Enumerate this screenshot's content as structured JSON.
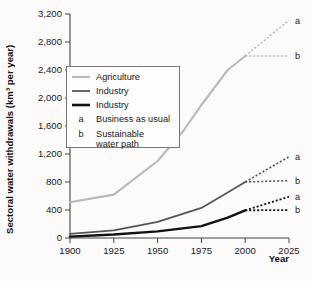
{
  "chart_data": {
    "type": "line",
    "title": "",
    "xlabel": "Year",
    "ylabel": "Sectoral water withdrawals (km³ per year)",
    "xlim": [
      1900,
      2025
    ],
    "ylim": [
      0,
      3200
    ],
    "xticks": [
      "1900",
      "1925",
      "1950",
      "1975",
      "2000",
      "2025"
    ],
    "yticks": [
      "0",
      "400",
      "800",
      "1,200",
      "1,600",
      "2,000",
      "2,400",
      "2,800",
      "3,200"
    ],
    "grid": false,
    "legend_position": "upper-left-inset",
    "series": [
      {
        "name": "Agriculture",
        "color": "#b9b9b9",
        "width": 2.1,
        "style": "solid",
        "x": [
          1900,
          1925,
          1950,
          1965,
          1975,
          1990,
          2000
        ],
        "values": [
          510,
          620,
          1100,
          1540,
          1900,
          2400,
          2600
        ]
      },
      {
        "name": "Industry",
        "color": "#555555",
        "width": 1.7,
        "style": "solid",
        "x": [
          1900,
          1925,
          1950,
          1975,
          1990,
          2000
        ],
        "values": [
          60,
          110,
          230,
          430,
          650,
          800
        ]
      },
      {
        "name": "Industry",
        "color": "#111111",
        "width": 2.4,
        "style": "solid",
        "x": [
          1900,
          1925,
          1950,
          1975,
          1990,
          2000
        ],
        "values": [
          20,
          50,
          95,
          170,
          290,
          395
        ]
      }
    ],
    "projections": [
      {
        "series": "Agriculture",
        "scenario": "a",
        "label": "a",
        "color": "#b9b9b9",
        "width": 1.6,
        "x": [
          2000,
          2025
        ],
        "values": [
          2600,
          3110
        ]
      },
      {
        "series": "Agriculture",
        "scenario": "b",
        "label": "b",
        "color": "#b9b9b9",
        "width": 1.6,
        "x": [
          2000,
          2025
        ],
        "values": [
          2600,
          2600
        ]
      },
      {
        "series": "Industry-1",
        "scenario": "a",
        "label": "a",
        "color": "#555555",
        "width": 1.6,
        "x": [
          2000,
          2025
        ],
        "values": [
          800,
          1160
        ]
      },
      {
        "series": "Industry-1",
        "scenario": "b",
        "label": "b",
        "color": "#555555",
        "width": 1.6,
        "x": [
          2000,
          2025
        ],
        "values": [
          800,
          820
        ]
      },
      {
        "series": "Industry-2",
        "scenario": "a",
        "label": "a",
        "color": "#111111",
        "width": 1.8,
        "x": [
          2000,
          2025
        ],
        "values": [
          395,
          590
        ]
      },
      {
        "series": "Industry-2",
        "scenario": "b",
        "label": "b",
        "color": "#111111",
        "width": 1.8,
        "x": [
          2000,
          2025
        ],
        "values": [
          395,
          400
        ]
      }
    ],
    "annotations": [
      {
        "label": "a",
        "x": 2025,
        "y": 3110
      },
      {
        "label": "b",
        "x": 2025,
        "y": 2600
      },
      {
        "label": "a",
        "x": 2025,
        "y": 1160
      },
      {
        "label": "b",
        "x": 2025,
        "y": 820
      },
      {
        "label": "a",
        "x": 2025,
        "y": 590
      },
      {
        "label": "b",
        "x": 2025,
        "y": 400
      }
    ]
  },
  "legend": {
    "entries": [
      {
        "key": "line",
        "color": "#b9b9b9",
        "width": 2.1,
        "label": "Agriculture"
      },
      {
        "key": "line",
        "color": "#555555",
        "width": 1.8,
        "label": "Industry"
      },
      {
        "key": "line",
        "color": "#111111",
        "width": 2.6,
        "label": "Industry"
      },
      {
        "key": "a",
        "color": "",
        "width": 0,
        "label": "Business as usual"
      },
      {
        "key": "b",
        "color": "",
        "width": 0,
        "label": "Sustainable water path"
      }
    ],
    "scenario_a_key": "a",
    "scenario_b_key": "b",
    "scenario_a_label": "Business as usual",
    "scenario_b_label_line1": "Sustainable",
    "scenario_b_label_line2": "water path"
  },
  "axis": {
    "y_title": "Sectoral water withdrawals (km³ per year)",
    "x_title": "Year"
  },
  "colors": {
    "agriculture": "#b9b9b9",
    "industry_light": "#555555",
    "industry_dark": "#111111",
    "axis": "#444444",
    "background": "#fcfbfa"
  }
}
